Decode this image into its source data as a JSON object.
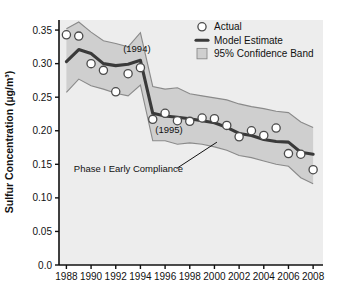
{
  "chart_data": {
    "type": "line",
    "title": "",
    "xlabel": "",
    "ylabel": "Sulfur Concentration (µg/m³)",
    "xlim": [
      1987.4,
      2008.8
    ],
    "ylim": [
      0.0,
      0.365
    ],
    "grid": false,
    "legend_position": "top-right",
    "x": [
      1988,
      1989,
      1990,
      1991,
      1992,
      1993,
      1994,
      1995,
      1996,
      1997,
      1998,
      1999,
      2000,
      2001,
      2002,
      2003,
      2004,
      2005,
      2006,
      2007,
      2008
    ],
    "xticks": [
      1988,
      1990,
      1992,
      1994,
      1996,
      1998,
      2000,
      2002,
      2004,
      2006,
      2008
    ],
    "xticklabels": [
      "1988",
      "1990",
      "1992",
      "1994",
      "1996",
      "1998",
      "2000",
      "2002",
      "2004",
      "2006",
      "2008"
    ],
    "yticks": [
      0.0,
      0.05,
      0.1,
      0.15,
      0.2,
      0.25,
      0.3,
      0.35
    ],
    "yticklabels": [
      "0.0",
      "0.05",
      "0.10",
      "0.15",
      "0.20",
      "0.25",
      "0.30",
      "0.35"
    ],
    "series": [
      {
        "name": "Actual",
        "style": "open-circle-markers",
        "values": [
          0.343,
          0.341,
          0.3,
          0.29,
          0.258,
          0.285,
          0.294,
          0.217,
          0.226,
          0.215,
          0.214,
          0.219,
          0.218,
          0.208,
          0.191,
          0.2,
          0.193,
          0.204,
          0.166,
          0.165,
          0.142
        ]
      },
      {
        "name": "Model Estimate",
        "style": "thick-line",
        "values": [
          0.303,
          0.321,
          0.315,
          0.3,
          0.297,
          0.299,
          0.305,
          0.226,
          0.222,
          0.22,
          0.218,
          0.215,
          0.212,
          0.205,
          0.196,
          0.193,
          0.187,
          0.184,
          0.183,
          0.168,
          0.165
        ]
      }
    ],
    "confidence_band": {
      "name": "95% Confidence Band",
      "level": "95%",
      "upper": [
        0.352,
        0.362,
        0.347,
        0.334,
        0.33,
        0.325,
        0.346,
        0.266,
        0.262,
        0.264,
        0.255,
        0.252,
        0.249,
        0.246,
        0.24,
        0.236,
        0.233,
        0.229,
        0.227,
        0.213,
        0.205
      ],
      "lower": [
        0.257,
        0.277,
        0.267,
        0.262,
        0.256,
        0.252,
        0.268,
        0.185,
        0.185,
        0.18,
        0.182,
        0.18,
        0.176,
        0.171,
        0.163,
        0.16,
        0.155,
        0.15,
        0.147,
        0.13,
        0.121
      ]
    },
    "annotations": [
      {
        "text": "(1994)",
        "x": 1992.6,
        "y": 0.318
      },
      {
        "text": "(1995)",
        "x": 1995.2,
        "y": 0.196
      },
      {
        "text": "Phase I Early Compliance",
        "x": 1988.6,
        "y": 0.138,
        "leader_to_x": 2000.2,
        "leader_to_y": 0.183
      }
    ]
  },
  "legend": {
    "items": [
      {
        "label": "Actual",
        "marker": "open-circle"
      },
      {
        "label": "Model Estimate",
        "marker": "thick-line"
      },
      {
        "label": "95% Confidence Band",
        "marker": "shaded-box"
      }
    ]
  },
  "colors": {
    "band_fill": "#cfcfcf",
    "band_edge": "#8a8a8a",
    "model_line": "#3a3a3a",
    "marker_edge": "#4a4a4a",
    "marker_fill": "#ffffff",
    "axis": "#111111",
    "plot_bg": "#ededed",
    "page_bg": "#ffffff"
  }
}
